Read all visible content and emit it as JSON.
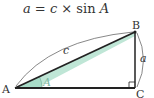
{
  "formula": {
    "lhs": "a",
    "eq": " = ",
    "c": "c",
    "times": " × ",
    "sin": "sin ",
    "angle": "A"
  },
  "diagram": {
    "vertices": {
      "A": {
        "label": "A",
        "x": 15,
        "y": 88
      },
      "B": {
        "label": "B",
        "x": 135,
        "y": 32
      },
      "C": {
        "label": "C",
        "x": 135,
        "y": 88
      }
    },
    "sides": {
      "hypotenuse": {
        "label": "c"
      },
      "opposite": {
        "label": "a"
      }
    },
    "angle_label": "A",
    "right_angle_at": "C",
    "colors": {
      "line": "#222222",
      "highlight": "#a8dcc8",
      "arc": "#555555",
      "angle_label": "#7fb8a4"
    }
  }
}
